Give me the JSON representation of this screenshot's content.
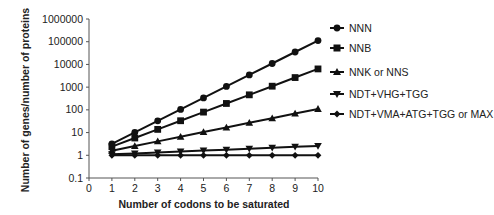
{
  "chart_data": {
    "type": "line",
    "title": "",
    "xlabel": "Number of codons to be saturated",
    "ylabel": "Number of genes/number of proteins",
    "yscale": "log",
    "xlim": [
      0,
      10
    ],
    "ylim": [
      0.1,
      1000000
    ],
    "x_ticks": [
      "0",
      "1",
      "2",
      "3",
      "4",
      "5",
      "6",
      "7",
      "8",
      "9",
      "10"
    ],
    "y_ticks": [
      "0.1",
      "1",
      "10",
      "100",
      "1000",
      "10000",
      "100000",
      "1000000"
    ],
    "grid": false,
    "legend_position": "right",
    "x": [
      1,
      2,
      3,
      4,
      5,
      6,
      7,
      8,
      9,
      10
    ],
    "series": [
      {
        "name": "NNN",
        "marker": "circle",
        "values": [
          3.2,
          10.24,
          32.77,
          104.86,
          335.54,
          1073.74,
          3435.97,
          10995.12,
          35184.37,
          112589.99
        ]
      },
      {
        "name": "NNB",
        "marker": "square",
        "values": [
          2.4,
          5.76,
          13.82,
          33.18,
          79.63,
          191.1,
          458.65,
          1100.75,
          2641.81,
          6340.34
        ]
      },
      {
        "name": "NNK or NNS",
        "marker": "triangle-up",
        "values": [
          1.6,
          2.56,
          4.1,
          6.55,
          10.49,
          16.78,
          26.84,
          42.95,
          68.72,
          109.95
        ]
      },
      {
        "name": "NDT+VHG+TGG",
        "marker": "triangle-down",
        "values": [
          1.1,
          1.21,
          1.33,
          1.46,
          1.61,
          1.77,
          1.95,
          2.14,
          2.36,
          2.59
        ]
      },
      {
        "name": "NDT+VMA+ATG+TGG or MAX",
        "marker": "diamond",
        "values": [
          1,
          1,
          1,
          1,
          1,
          1,
          1,
          1,
          1,
          1
        ]
      }
    ]
  },
  "legend": {
    "items": [
      {
        "label": "NNN"
      },
      {
        "label": "NNB"
      },
      {
        "label": "NNK or NNS"
      },
      {
        "label": "NDT+VHG+TGG"
      },
      {
        "label": "NDT+VMA+ATG+TGG or MAX"
      }
    ]
  },
  "colors": {
    "line": "#111111",
    "axis": "#555555",
    "text": "#222222"
  }
}
